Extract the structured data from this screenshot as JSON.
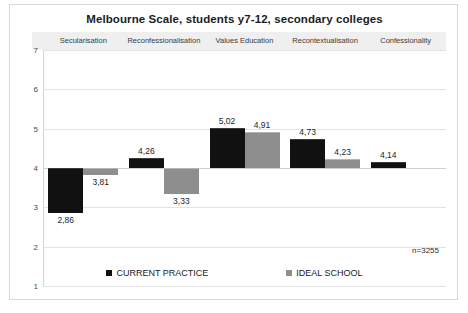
{
  "chart_data": {
    "type": "bar",
    "title": "Melbourne Scale, students y7-12, secondary colleges",
    "xlabel": "",
    "ylabel": "",
    "ylim": [
      1,
      7
    ],
    "yticks": [
      1,
      2,
      3,
      4,
      5,
      6,
      7
    ],
    "baseline": 4,
    "grid": true,
    "legend_position": "bottom",
    "annotation": "n=3255",
    "categories": [
      "Secularisation",
      "Reconfessionalisation",
      "Values Education",
      "Recontextualisation",
      "Confessionality"
    ],
    "series": [
      {
        "name": "CURRENT PRACTICE",
        "color": "#111111",
        "values": [
          2.86,
          4.26,
          5.02,
          4.73,
          4.14
        ],
        "labels": [
          "2,86",
          "4,26",
          "5,02",
          "4,73",
          "4,14"
        ]
      },
      {
        "name": "IDEAL SCHOOL",
        "color": "#8e8e8e",
        "values": [
          3.81,
          3.33,
          4.91,
          4.23,
          4.0
        ],
        "labels": [
          "3,81",
          "3,33",
          "4,91",
          "4,23",
          ""
        ]
      }
    ]
  },
  "legend": {
    "items": [
      {
        "label": "CURRENT PRACTICE",
        "swatch": "current"
      },
      {
        "label": "IDEAL SCHOOL",
        "swatch": "ideal"
      }
    ]
  }
}
